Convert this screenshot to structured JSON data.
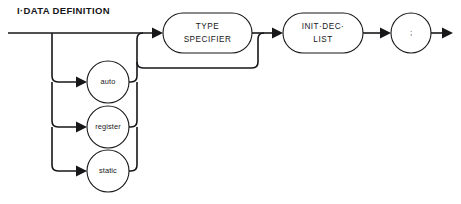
{
  "diagram": {
    "title": "I·DATA DEFINITION",
    "type": "railroad-syntax-diagram",
    "colors": {
      "line": "#17171a",
      "text": "#17171a",
      "background": "#ffffff",
      "node_fill": "#ffffff"
    },
    "nodes": [
      {
        "id": "type-specifier",
        "kind": "nonterminal",
        "shape": "stadium",
        "lines": [
          "TYPE",
          "SPECIFIER"
        ],
        "x": 163,
        "y": 13,
        "w": 89,
        "h": 40
      },
      {
        "id": "init-dec-list",
        "kind": "nonterminal",
        "shape": "stadium",
        "lines": [
          "INIT·DEC·",
          "LIST"
        ],
        "x": 283,
        "y": 13,
        "w": 80,
        "h": 40
      },
      {
        "id": "semicolon",
        "kind": "terminal",
        "shape": "circle",
        "lines": [
          ";"
        ],
        "cx": 411,
        "cy": 33,
        "r": 20
      },
      {
        "id": "auto",
        "kind": "terminal",
        "shape": "circle",
        "lines": [
          "auto"
        ],
        "cx": 108,
        "cy": 82,
        "r": 21
      },
      {
        "id": "register",
        "kind": "terminal",
        "shape": "circle",
        "lines": [
          "register"
        ],
        "cx": 108,
        "cy": 127,
        "r": 21
      },
      {
        "id": "static",
        "kind": "terminal",
        "shape": "circle",
        "lines": [
          "static"
        ],
        "cx": 108,
        "cy": 171,
        "r": 21
      }
    ],
    "rails": {
      "entry_x": 8,
      "main_y": 33,
      "exit_x": 453,
      "branch_left_x": 52,
      "branch_right_x": 137,
      "bypass_y": 68,
      "bypass_join_x": 258
    }
  }
}
